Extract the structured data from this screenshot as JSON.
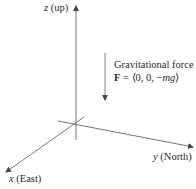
{
  "diagram": {
    "axes": {
      "z": {
        "var": "z",
        "label": " (up)"
      },
      "y": {
        "var": "y",
        "label": " (North)"
      },
      "x": {
        "var": "x",
        "label": " (East)"
      }
    },
    "force": {
      "title": "Gravitational force",
      "vector_symbol": "F",
      "equals": " = ⟨0, 0, −",
      "component": "mg",
      "close": "⟩"
    },
    "colors": {
      "line": "#555555",
      "text": "#2a2a2a"
    }
  }
}
